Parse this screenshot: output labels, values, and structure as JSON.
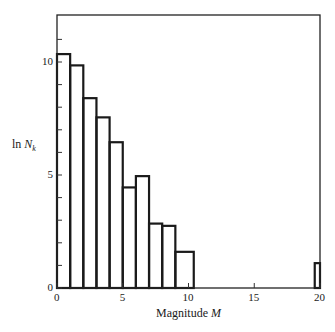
{
  "chart_data": {
    "type": "bar",
    "title": "",
    "xlabel": "Magnitude M",
    "ylabel": "ln N_k",
    "xlim": [
      0,
      20
    ],
    "ylim": [
      0,
      12
    ],
    "grid": false,
    "legend": null,
    "x_ticks": [
      0,
      5,
      10,
      15,
      20
    ],
    "y_ticks": [
      0,
      5,
      10
    ],
    "y_minor_ticks": [
      1,
      2,
      3,
      4,
      6,
      7,
      8,
      9,
      11
    ],
    "bins": [
      {
        "x0": 0,
        "x1": 1,
        "value": 10.35
      },
      {
        "x0": 1,
        "x1": 2,
        "value": 9.85
      },
      {
        "x0": 2,
        "x1": 3,
        "value": 8.4
      },
      {
        "x0": 3,
        "x1": 4,
        "value": 7.55
      },
      {
        "x0": 4,
        "x1": 5,
        "value": 6.45
      },
      {
        "x0": 5,
        "x1": 6,
        "value": 4.45
      },
      {
        "x0": 6,
        "x1": 7,
        "value": 4.95
      },
      {
        "x0": 7,
        "x1": 8,
        "value": 2.85
      },
      {
        "x0": 8,
        "x1": 9,
        "value": 2.75
      },
      {
        "x0": 9,
        "x1": 10.4,
        "value": 1.6
      },
      {
        "x0": 19.6,
        "x1": 20,
        "value": 1.1
      }
    ]
  },
  "labels": {
    "xlabel_text": "Magnitude ",
    "xlabel_var": "M",
    "ylabel_prefix": "ln ",
    "ylabel_var": "N",
    "ylabel_sub": "k",
    "x_tick_labels": [
      "0",
      "5",
      "10",
      "15",
      "20"
    ],
    "y_tick_labels": [
      "0",
      "5",
      "10"
    ]
  }
}
